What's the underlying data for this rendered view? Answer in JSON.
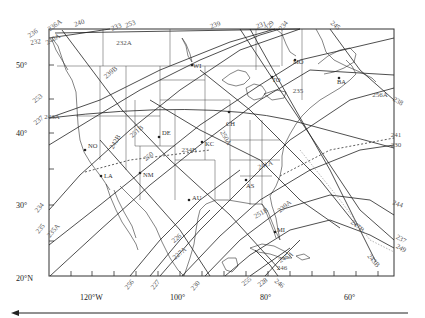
{
  "map": {
    "lat_labels": [
      {
        "text": "50°",
        "y": 65
      },
      {
        "text": "40°",
        "y": 133
      },
      {
        "text": "30°",
        "y": 205
      },
      {
        "text": "20°N",
        "y": 278
      }
    ],
    "lon_labels": [
      {
        "text": "120°W",
        "x": 88
      },
      {
        "text": "100°",
        "x": 178
      },
      {
        "text": "80°",
        "x": 265
      },
      {
        "text": "60°",
        "x": 350
      }
    ],
    "stations": [
      {
        "code": "DE",
        "x": 159,
        "y": 137
      },
      {
        "code": "KC",
        "x": 202,
        "y": 142
      },
      {
        "code": "NM",
        "x": 140,
        "y": 173
      },
      {
        "code": "LA",
        "x": 101,
        "y": 176
      },
      {
        "code": "NO",
        "x": 85,
        "y": 150
      },
      {
        "code": "AU",
        "x": 189,
        "y": 200
      },
      {
        "code": "AS",
        "x": 246,
        "y": 180
      },
      {
        "code": "MO",
        "x": 295,
        "y": 60
      },
      {
        "code": "TO",
        "x": 272,
        "y": 77
      },
      {
        "code": "BA",
        "x": 339,
        "y": 78
      },
      {
        "code": "WI",
        "x": 192,
        "y": 65
      },
      {
        "code": "MI",
        "x": 275,
        "y": 232
      },
      {
        "code": "CH",
        "x": 229,
        "y": 112
      }
    ],
    "track_labels": [
      {
        "text": "236",
        "x": 34,
        "y": 35,
        "rot": -35
      },
      {
        "text": "236A",
        "x": 56,
        "y": 27,
        "rot": -35
      },
      {
        "text": "232",
        "x": 36,
        "y": 44,
        "rot": -10
      },
      {
        "text": "240A",
        "x": 54,
        "y": 41,
        "rot": -30
      },
      {
        "text": "240",
        "x": 80,
        "y": 25,
        "rot": -20
      },
      {
        "text": "253",
        "x": 131,
        "y": 26,
        "rot": -20
      },
      {
        "text": "233",
        "x": 117,
        "y": 29,
        "rot": -20
      },
      {
        "text": "232A",
        "x": 124,
        "y": 45,
        "rot": 0
      },
      {
        "text": "239",
        "x": 216,
        "y": 27,
        "rot": -20
      },
      {
        "text": "231",
        "x": 262,
        "y": 27,
        "rot": -20
      },
      {
        "text": "229",
        "x": 271,
        "y": 27,
        "rot": -50
      },
      {
        "text": "234",
        "x": 285,
        "y": 27,
        "rot": -50
      },
      {
        "text": "245",
        "x": 334,
        "y": 27,
        "rot": 40
      },
      {
        "text": "238",
        "x": 397,
        "y": 103,
        "rot": 30
      },
      {
        "text": "256A",
        "x": 380,
        "y": 97,
        "rot": 0
      },
      {
        "text": "235",
        "x": 298,
        "y": 93,
        "rot": 0
      },
      {
        "text": "239B",
        "x": 112,
        "y": 74,
        "rot": -40
      },
      {
        "text": "253",
        "x": 39,
        "y": 100,
        "rot": -40
      },
      {
        "text": "237",
        "x": 40,
        "y": 122,
        "rot": -40
      },
      {
        "text": "243A",
        "x": 52,
        "y": 119,
        "rot": 0
      },
      {
        "text": "242B",
        "x": 117,
        "y": 143,
        "rot": -60
      },
      {
        "text": "251B",
        "x": 138,
        "y": 133,
        "rot": -40
      },
      {
        "text": "234B",
        "x": 189,
        "y": 152,
        "rot": 0
      },
      {
        "text": "250",
        "x": 150,
        "y": 158,
        "rot": -40
      },
      {
        "text": "250A",
        "x": 224,
        "y": 139,
        "rot": 60
      },
      {
        "text": "241A",
        "x": 266,
        "y": 167,
        "rot": -20
      },
      {
        "text": "241",
        "x": 396,
        "y": 137,
        "rot": 0
      },
      {
        "text": "230",
        "x": 396,
        "y": 147,
        "rot": 0
      },
      {
        "text": "244",
        "x": 397,
        "y": 206,
        "rot": 20
      },
      {
        "text": "247B",
        "x": 356,
        "y": 228,
        "rot": 40
      },
      {
        "text": "237",
        "x": 400,
        "y": 241,
        "rot": 30
      },
      {
        "text": "249",
        "x": 400,
        "y": 250,
        "rot": 30
      },
      {
        "text": "243B",
        "x": 372,
        "y": 262,
        "rot": 50
      },
      {
        "text": "234",
        "x": 41,
        "y": 209,
        "rot": -50
      },
      {
        "text": "235",
        "x": 42,
        "y": 230,
        "rot": -50
      },
      {
        "text": "235A",
        "x": 55,
        "y": 232,
        "rot": -50
      },
      {
        "text": "256",
        "x": 131,
        "y": 286,
        "rot": -50
      },
      {
        "text": "226",
        "x": 178,
        "y": 240,
        "rot": -40
      },
      {
        "text": "227A",
        "x": 181,
        "y": 255,
        "rot": -40
      },
      {
        "text": "227",
        "x": 157,
        "y": 286,
        "rot": -50
      },
      {
        "text": "230",
        "x": 197,
        "y": 287,
        "rot": -50
      },
      {
        "text": "255",
        "x": 248,
        "y": 283,
        "rot": -40
      },
      {
        "text": "228",
        "x": 264,
        "y": 284,
        "rot": -40
      },
      {
        "text": "246",
        "x": 278,
        "y": 285,
        "rot": 40
      },
      {
        "text": "245A",
        "x": 287,
        "y": 259,
        "rot": -30
      },
      {
        "text": "246",
        "x": 282,
        "y": 270,
        "rot": 0
      },
      {
        "text": "251B",
        "x": 262,
        "y": 215,
        "rot": -30
      },
      {
        "text": "239A",
        "x": 286,
        "y": 208,
        "rot": -40
      }
    ]
  },
  "footer": {
    "arrow_direction": "left"
  }
}
